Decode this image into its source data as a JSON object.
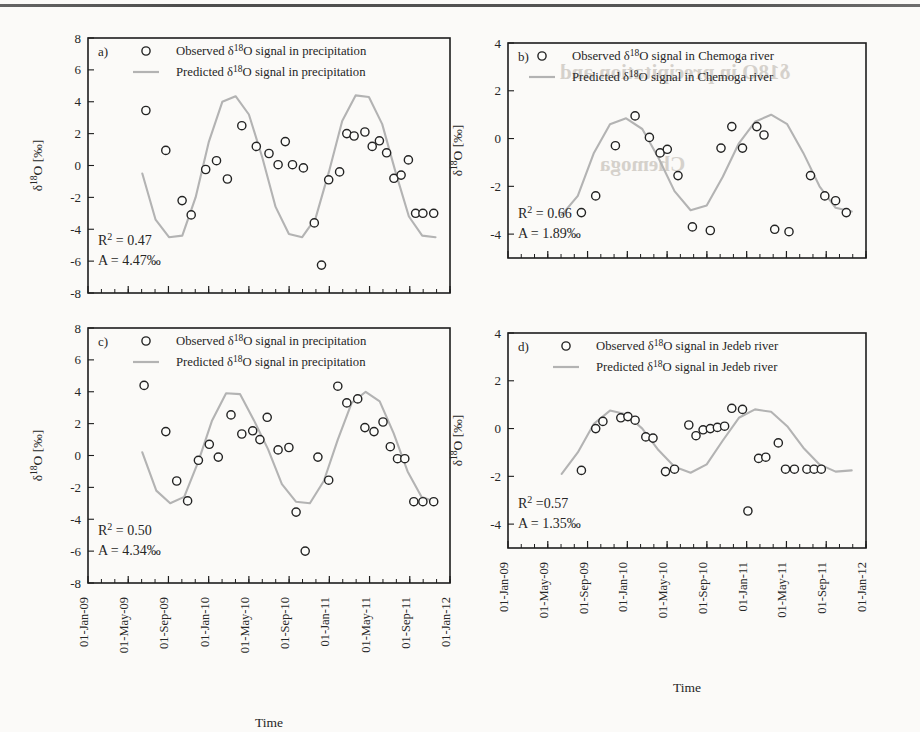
{
  "figure": {
    "axis_title_x": "Time",
    "axis_title_y": "δ18O [‰]",
    "y_label_parts": {
      "delta": "δ",
      "mass": "18",
      "element": "O",
      "unit": "[‰]"
    },
    "legend": {
      "observed_marker": "open-circle-marker",
      "predicted_marker": "grey-line-marker"
    },
    "x_tick_labels": [
      "01-Jan-09",
      "01-May-09",
      "01-Sep-09",
      "01-Jan-10",
      "01-May-10",
      "01-Sep-10",
      "01-Jan-11",
      "01-May-11",
      "01-Sep-11",
      "01-Jan-12"
    ],
    "colors": {
      "observed_stroke": "#232323",
      "observed_fill": "#fdfdfb",
      "predicted_line": "#b3b3b3",
      "axis": "#1d1d1d",
      "page_background": "#fbfaf8"
    },
    "bleed_through_text": [
      "δ18O in precipitation and",
      "Chemoga",
      "the Chemoga and Jedeb"
    ]
  },
  "chart_data": [
    {
      "id": "panel-a",
      "type": "scatter",
      "tag": "a)",
      "title": "",
      "xlabel": "Time",
      "ylabel": "δ18O [‰]",
      "ylim": [
        -8,
        8
      ],
      "yticks": [
        8,
        6,
        4,
        2,
        0,
        -2,
        -4,
        -6,
        -8
      ],
      "xlim": [
        "01-Jan-09",
        "01-Jan-12"
      ],
      "xticks": [
        "01-Jan-09",
        "01-May-09",
        "01-Sep-09",
        "01-Jan-10",
        "01-May-10",
        "01-Sep-10",
        "01-Jan-11",
        "01-May-11",
        "01-Sep-11",
        "01-Jan-12"
      ],
      "grid": false,
      "legend_position": "top-right-inside",
      "series": [
        {
          "name": "Observed δ18O signal in precipitation",
          "kind": "scatter",
          "marker": "open-circle",
          "x": [
            0.16,
            0.215,
            0.26,
            0.285,
            0.325,
            0.355,
            0.385,
            0.425,
            0.465,
            0.5,
            0.525,
            0.545,
            0.565,
            0.595,
            0.625,
            0.645,
            0.665,
            0.695,
            0.715,
            0.735,
            0.765,
            0.785,
            0.805,
            0.825,
            0.845,
            0.865,
            0.885,
            0.905,
            0.925,
            0.955
          ],
          "y": [
            3.45,
            0.95,
            -2.2,
            -3.1,
            -0.25,
            0.3,
            -0.85,
            2.5,
            1.2,
            0.75,
            0.05,
            1.5,
            0.05,
            -0.15,
            -3.6,
            -6.25,
            -0.9,
            -0.4,
            2.0,
            1.85,
            2.1,
            1.2,
            1.55,
            0.8,
            -0.8,
            -0.6,
            0.35,
            -3.0,
            -3.0,
            -3.0
          ]
        },
        {
          "name": "Predicted δ18O signal in precipitation",
          "kind": "line",
          "amplitude": 4.47,
          "y_at_sampled_x": [
            -0.5,
            -3.4,
            -4.5,
            -4.4,
            -2.0,
            1.5,
            4.0,
            4.35,
            3.2,
            0.5,
            -2.6,
            -4.3,
            -4.5,
            -3.3,
            -0.4,
            2.8,
            4.4,
            4.3,
            2.6,
            -0.4,
            -3.2,
            -4.4,
            -4.5
          ]
        }
      ],
      "annotations": {
        "r2_label": "R2 = 0.47",
        "r2_value": "0.47",
        "amplitude_label": "A = 4.47‰",
        "amplitude_value": "4.47‰"
      }
    },
    {
      "id": "panel-b",
      "type": "scatter",
      "tag": "b)",
      "title": "",
      "xlabel": "Time",
      "ylabel": "δ18O [‰]",
      "ylim": [
        -5,
        4
      ],
      "yticks": [
        4,
        2,
        0,
        -2,
        -4
      ],
      "xlim": [
        "01-Jan-09",
        "01-Jan-12"
      ],
      "xticks": [
        "01-Jan-09",
        "01-May-09",
        "01-Sep-09",
        "01-Jan-10",
        "01-May-10",
        "01-Sep-10",
        "01-Jan-11",
        "01-May-11",
        "01-Sep-11",
        "01-Jan-12"
      ],
      "grid": false,
      "legend_position": "top-right-inside",
      "series": [
        {
          "name": "Observed δ18O signal in Chemoga river",
          "kind": "scatter",
          "marker": "open-circle",
          "x": [
            0.205,
            0.245,
            0.3,
            0.355,
            0.395,
            0.425,
            0.445,
            0.475,
            0.515,
            0.565,
            0.595,
            0.625,
            0.655,
            0.695,
            0.715,
            0.745,
            0.785,
            0.845,
            0.885,
            0.915,
            0.945
          ],
          "y": [
            -3.1,
            -2.4,
            -0.3,
            0.95,
            0.05,
            -0.6,
            -0.45,
            -1.55,
            -3.7,
            -3.85,
            -0.4,
            0.5,
            -0.4,
            0.5,
            0.15,
            -3.8,
            -3.9,
            -1.55,
            -2.4,
            -2.6,
            -3.1
          ]
        },
        {
          "name": "Predicted δ18O signal  in Chemoga river",
          "kind": "line",
          "amplitude": 1.89,
          "y_at_sampled_x": [
            -3.2,
            -2.4,
            -0.6,
            0.6,
            0.85,
            0.4,
            -0.8,
            -2.2,
            -3.0,
            -2.8,
            -1.6,
            -0.2,
            0.7,
            1.0,
            0.6,
            -0.6,
            -2.0,
            -2.9,
            -3.05
          ]
        }
      ],
      "annotations": {
        "r2_label": "R2 = 0.66",
        "r2_value": "0.66",
        "amplitude_label": "A = 1.89‰",
        "amplitude_value": "1.89‰"
      }
    },
    {
      "id": "panel-c",
      "type": "scatter",
      "tag": "c)",
      "title": "",
      "xlabel": "Time",
      "ylabel": "δ18O [‰]",
      "ylim": [
        -8,
        8
      ],
      "yticks": [
        8,
        6,
        4,
        2,
        0,
        -2,
        -4,
        -6,
        -8
      ],
      "xlim": [
        "01-Jan-09",
        "01-Jan-12"
      ],
      "xticks": [
        "01-Jan-09",
        "01-May-09",
        "01-Sep-09",
        "01-Jan-10",
        "01-May-10",
        "01-Sep-10",
        "01-Jan-11",
        "01-May-11",
        "01-Sep-11",
        "01-Jan-12"
      ],
      "grid": false,
      "legend_position": "top-right-inside",
      "series": [
        {
          "name": "Observed δ18O signal in precipitation",
          "kind": "scatter",
          "marker": "open-circle",
          "x": [
            0.155,
            0.215,
            0.245,
            0.275,
            0.305,
            0.335,
            0.36,
            0.395,
            0.425,
            0.455,
            0.475,
            0.495,
            0.525,
            0.555,
            0.575,
            0.6,
            0.635,
            0.665,
            0.69,
            0.715,
            0.745,
            0.765,
            0.79,
            0.815,
            0.835,
            0.855,
            0.875,
            0.9,
            0.925,
            0.955
          ],
          "y": [
            4.4,
            1.5,
            -1.6,
            -2.85,
            -0.3,
            0.7,
            -0.1,
            2.55,
            1.35,
            1.55,
            1.0,
            2.4,
            0.35,
            0.5,
            -3.55,
            -6.0,
            -0.1,
            -1.55,
            4.35,
            3.3,
            3.55,
            1.75,
            1.5,
            2.1,
            0.55,
            -0.2,
            -0.2,
            -2.9,
            -2.9,
            -2.9
          ]
        },
        {
          "name": "Predicted δ18O signal in precipitation",
          "kind": "line",
          "amplitude": 4.34,
          "y_at_sampled_x": [
            0.2,
            -2.2,
            -3.0,
            -2.6,
            -0.4,
            2.2,
            3.9,
            3.85,
            2.2,
            0.4,
            -1.8,
            -2.9,
            -3.0,
            -1.6,
            1.0,
            3.3,
            4.0,
            3.4,
            1.4,
            -1.0,
            -2.6,
            -2.9
          ]
        }
      ],
      "annotations": {
        "r2_label": "R2 = 0.50",
        "r2_value": "0.50",
        "amplitude_label": "A = 4.34‰",
        "amplitude_value": "4.34‰"
      }
    },
    {
      "id": "panel-d",
      "type": "scatter",
      "tag": "d)",
      "title": "",
      "xlabel": "Time",
      "ylabel": "δ18O [‰]",
      "ylim": [
        -5,
        4
      ],
      "yticks": [
        4,
        2,
        0,
        -2,
        -4
      ],
      "xlim": [
        "01-Jan-09",
        "01-Jan-12"
      ],
      "xticks": [
        "01-Jan-09",
        "01-May-09",
        "01-Sep-09",
        "01-Jan-10",
        "01-May-10",
        "01-Sep-10",
        "01-Jan-11",
        "01-May-11",
        "01-Sep-11",
        "01-Jan-12"
      ],
      "grid": false,
      "legend_position": "top-right-inside",
      "series": [
        {
          "name": "Observed δ18O signal in Jedeb river",
          "kind": "scatter",
          "marker": "open-circle",
          "x": [
            0.205,
            0.245,
            0.265,
            0.315,
            0.335,
            0.355,
            0.385,
            0.405,
            0.44,
            0.465,
            0.505,
            0.525,
            0.545,
            0.565,
            0.585,
            0.605,
            0.625,
            0.655,
            0.67,
            0.7,
            0.72,
            0.755,
            0.775,
            0.8,
            0.835,
            0.855,
            0.875
          ],
          "y": [
            -1.75,
            0.0,
            0.3,
            0.45,
            0.5,
            0.35,
            -0.35,
            -0.4,
            -1.8,
            -1.7,
            0.15,
            -0.3,
            -0.05,
            0.0,
            0.05,
            0.1,
            0.85,
            0.8,
            -3.45,
            -1.25,
            -1.2,
            -0.6,
            -1.7,
            -1.7,
            -1.7,
            -1.7,
            -1.7
          ]
        },
        {
          "name": "Predicted δ18O signal  in Jedeb river",
          "kind": "line",
          "amplitude": 1.35,
          "y_at_sampled_x": [
            -1.9,
            -1.0,
            0.2,
            0.75,
            0.6,
            0.0,
            -0.9,
            -1.6,
            -1.85,
            -1.5,
            -0.5,
            0.45,
            0.8,
            0.7,
            0.1,
            -0.8,
            -1.5,
            -1.8,
            -1.75
          ]
        }
      ],
      "annotations": {
        "r2_label": "R2 =0.57",
        "r2_value": "0.57",
        "amplitude_label": "A = 1.35‰",
        "amplitude_value": "1.35‰"
      }
    }
  ]
}
